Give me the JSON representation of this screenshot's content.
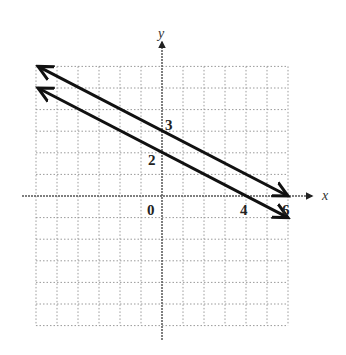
{
  "chart_data": {
    "type": "line",
    "title": "",
    "xlabel": "x",
    "ylabel": "y",
    "xlim": [
      -6,
      6
    ],
    "ylim": [
      -6,
      6
    ],
    "grid": true,
    "grid_style": "dotted",
    "series": [
      {
        "name": "line-1",
        "equation": "x + 2y = 6",
        "points": [
          [
            -6,
            6
          ],
          [
            0,
            3
          ],
          [
            6,
            0
          ]
        ],
        "x_intercept": 6,
        "y_intercept": 3,
        "arrows": "both"
      },
      {
        "name": "line-2",
        "equation": "x + 2y = 4",
        "points": [
          [
            -6,
            5
          ],
          [
            0,
            2
          ],
          [
            4,
            0
          ],
          [
            6,
            -1
          ]
        ],
        "x_intercept": 4,
        "y_intercept": 2,
        "arrows": "both"
      }
    ],
    "annotations": [
      {
        "text": "3",
        "at": [
          0,
          3
        ]
      },
      {
        "text": "2",
        "at": [
          0,
          2
        ]
      },
      {
        "text": "0",
        "at": [
          0,
          0
        ]
      },
      {
        "text": "4",
        "at": [
          4,
          0
        ]
      },
      {
        "text": "6",
        "at": [
          6,
          0
        ]
      }
    ]
  },
  "labels": {
    "x_axis": "x",
    "y_axis": "y",
    "origin": "0",
    "y_int_1": "3",
    "y_int_2": "2",
    "x_int_2": "4",
    "x_int_1": "6"
  },
  "colors": {
    "line": "#111111",
    "grid": "#9a9a9a",
    "axis": "#555555"
  }
}
